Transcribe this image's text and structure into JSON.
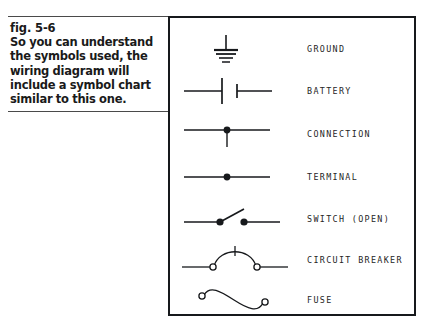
{
  "caption": {
    "figure_number": "fig. 5-6",
    "text": "So you can understand the symbols used, the wiring diagram will include a symbol chart similar to this one."
  },
  "symbol_chart": {
    "rows": [
      {
        "label": "GROUND",
        "symbol": "ground-symbol"
      },
      {
        "label": "BATTERY",
        "symbol": "battery-symbol"
      },
      {
        "label": "CONNECTION",
        "symbol": "connection-symbol"
      },
      {
        "label": "TERMINAL",
        "symbol": "terminal-symbol"
      },
      {
        "label": "SWITCH (OPEN)",
        "symbol": "switch-open-symbol"
      },
      {
        "label": "CIRCUIT BREAKER",
        "symbol": "circuit-breaker-symbol"
      },
      {
        "label": "FUSE",
        "symbol": "fuse-symbol"
      }
    ]
  },
  "colors": {
    "ink": "#17191c",
    "rule": "#4a4a4a",
    "label_ink": "#262626",
    "background": "#ffffff"
  }
}
